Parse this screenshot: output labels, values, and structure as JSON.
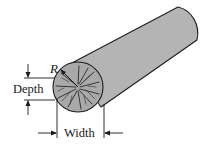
{
  "figure": {
    "labels": {
      "radius": "R",
      "depth": "Depth",
      "width": "Width"
    },
    "colors": {
      "body_fill": "#b4b4b4",
      "end_face_fill": "#a9a9a9",
      "outline": "#1e1e1e",
      "grain": "#2a2a2a",
      "background": "#ffffff"
    }
  }
}
